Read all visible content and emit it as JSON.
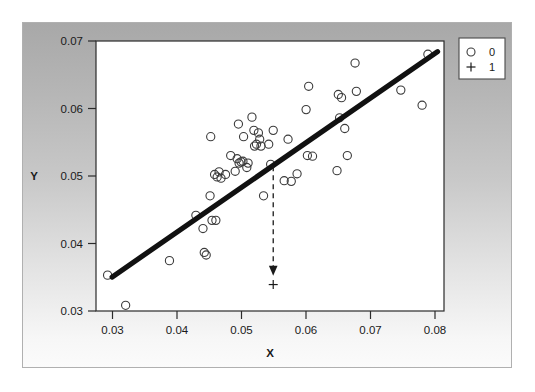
{
  "chart_data": {
    "type": "scatter",
    "title": "",
    "xlabel": "X",
    "ylabel": "Y",
    "xlim": [
      0.0285,
      0.0825
    ],
    "ylim": [
      0.0283,
      0.0712
    ],
    "grid": false,
    "legend_position": "outside-top-right",
    "x_ticks": [
      "0.03",
      "0.04",
      "0.05",
      "0.06",
      "0.07",
      "0.08"
    ],
    "x_tick_values": [
      0.03,
      0.04,
      0.05,
      0.06,
      0.07,
      0.08
    ],
    "y_ticks": [
      "0.03",
      "0.04",
      "0.05",
      "0.06",
      "0.07"
    ],
    "y_tick_values": [
      0.03,
      0.04,
      0.05,
      0.06,
      0.07
    ],
    "legend": [
      {
        "label": "0",
        "marker": "circle-open-marker"
      },
      {
        "label": "1",
        "marker": "plus-marker"
      }
    ],
    "series": [
      {
        "name": "0",
        "marker": "circle-open-marker",
        "points": [
          [
            0.0303,
            0.034
          ],
          [
            0.0331,
            0.0292
          ],
          [
            0.0399,
            0.0363
          ],
          [
            0.044,
            0.0435
          ],
          [
            0.0451,
            0.0414
          ],
          [
            0.0453,
            0.0376
          ],
          [
            0.0456,
            0.0372
          ],
          [
            0.0462,
            0.0466
          ],
          [
            0.0463,
            0.056
          ],
          [
            0.0465,
            0.0427
          ],
          [
            0.0469,
            0.05
          ],
          [
            0.0471,
            0.0427
          ],
          [
            0.0473,
            0.0496
          ],
          [
            0.0476,
            0.0504
          ],
          [
            0.0479,
            0.0494
          ],
          [
            0.0486,
            0.05
          ],
          [
            0.0494,
            0.053
          ],
          [
            0.0501,
            0.0505
          ],
          [
            0.0504,
            0.0525
          ],
          [
            0.0506,
            0.058
          ],
          [
            0.0507,
            0.0518
          ],
          [
            0.051,
            0.052
          ],
          [
            0.0513,
            0.0521
          ],
          [
            0.0514,
            0.056
          ],
          [
            0.0519,
            0.0511
          ],
          [
            0.0521,
            0.0518
          ],
          [
            0.0527,
            0.0591
          ],
          [
            0.053,
            0.057
          ],
          [
            0.0531,
            0.0545
          ],
          [
            0.0534,
            0.0548
          ],
          [
            0.0537,
            0.0566
          ],
          [
            0.0539,
            0.0556
          ],
          [
            0.0541,
            0.0545
          ],
          [
            0.0545,
            0.0466
          ],
          [
            0.0553,
            0.0548
          ],
          [
            0.0556,
            0.0516
          ],
          [
            0.056,
            0.057
          ],
          [
            0.0577,
            0.049
          ],
          [
            0.0583,
            0.0556
          ],
          [
            0.0588,
            0.0489
          ],
          [
            0.0597,
            0.0501
          ],
          [
            0.0611,
            0.0603
          ],
          [
            0.0613,
            0.053
          ],
          [
            0.0615,
            0.064
          ],
          [
            0.0621,
            0.0529
          ],
          [
            0.0659,
            0.0506
          ],
          [
            0.0661,
            0.0627
          ],
          [
            0.0663,
            0.059
          ],
          [
            0.0666,
            0.0622
          ],
          [
            0.0671,
            0.0573
          ],
          [
            0.0675,
            0.053
          ],
          [
            0.0687,
            0.0677
          ],
          [
            0.0689,
            0.0632
          ],
          [
            0.0758,
            0.0634
          ],
          [
            0.0791,
            0.061
          ],
          [
            0.08,
            0.0691
          ]
        ]
      },
      {
        "name": "1",
        "marker": "plus-marker",
        "points": [
          [
            0.056,
            0.0325
          ]
        ]
      }
    ],
    "fit_line": {
      "name": "regression-line",
      "x_start": 0.031,
      "y_start": 0.0337,
      "x_end": 0.0815,
      "y_end": 0.0695
    },
    "annotation_arrow": {
      "name": "projection-arrow",
      "x": 0.056,
      "y_start": 0.0513,
      "y_end": 0.0342,
      "style": "dashed-down-arrow"
    }
  }
}
